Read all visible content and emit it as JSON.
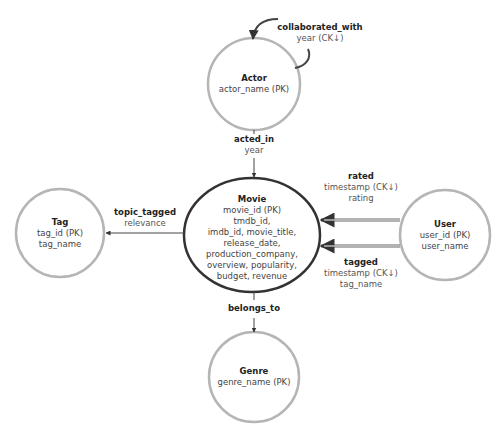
{
  "colors": {
    "entity_stroke": "#b5b5b5",
    "central_stroke": "#333333",
    "edge": "#444444",
    "text": "#444444",
    "title_text": "#222222"
  },
  "entities": {
    "actor": {
      "name": "Actor",
      "attrs": [
        "actor_name (PK)"
      ]
    },
    "movie": {
      "name": "Movie",
      "attrs": [
        "movie_id (PK)",
        "tmdb_id,",
        "imdb_id, movie_title,",
        "release_date,",
        "production_company,",
        "overview, popularity,",
        "budget, revenue"
      ]
    },
    "tag": {
      "name": "Tag",
      "attrs": [
        "tag_id (PK)",
        "tag_name"
      ]
    },
    "user": {
      "name": "User",
      "attrs": [
        "user_id (PK)",
        "user_name"
      ]
    },
    "genre": {
      "name": "Genre",
      "attrs": [
        "genre_name (PK)"
      ]
    }
  },
  "relationships": {
    "collaborated_with": {
      "name": "collaborated_with",
      "attrs": [
        "year (CK↓)"
      ]
    },
    "acted_in": {
      "name": "acted_in",
      "attrs": [
        "year"
      ]
    },
    "topic_tagged": {
      "name": "topic_tagged",
      "attrs": [
        "relevance"
      ]
    },
    "rated": {
      "name": "rated",
      "attrs": [
        "timestamp (CK↓)",
        "rating"
      ]
    },
    "tagged": {
      "name": "tagged",
      "attrs": [
        "timestamp (CK↓)",
        "tag_name"
      ]
    },
    "belongs_to": {
      "name": "belongs_to",
      "attrs": []
    }
  }
}
